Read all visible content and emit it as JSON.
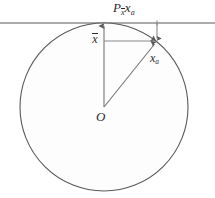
{
  "figure": {
    "name": "projection-of-xa-onto-xbar",
    "background_color": "#ffffff",
    "stroke_color": "#595959",
    "label_color": "#2b2b2b",
    "circle_fill": "#fdfdfd",
    "width": 215,
    "height": 198
  },
  "labels": {
    "projection": {
      "base": "P",
      "sub_base": "x",
      "sub_overbar": true,
      "operand_base": "x",
      "operand_sub": "a",
      "text": "P"
    },
    "xbar": {
      "base": "x",
      "overbar": true,
      "text": "x"
    },
    "xa": {
      "base": "x",
      "sub": "a",
      "text": "x"
    },
    "origin": {
      "text": "O"
    }
  },
  "text": {
    "projection_main": "P",
    "projection_sub_x": "x",
    "projection_operand": "x",
    "projection_operand_sub": "a",
    "xbar_main": "x",
    "xa_main": "x",
    "xa_sub": "a",
    "origin_main": "O"
  },
  "geometry": {
    "circle": {
      "cx": 104,
      "cy": 107,
      "r": 84
    },
    "origin_point": {
      "x": 104,
      "y": 107
    },
    "tangent_point": {
      "x": 104,
      "y": 23
    },
    "xa_point": {
      "x": 157,
      "y": 41
    },
    "projection_point": {
      "x": 157,
      "y": 23
    },
    "horizontal_line": {
      "y": 23,
      "x_start": 0,
      "x_end": 215
    },
    "xbar_vector": {
      "from": [
        104,
        107
      ],
      "to": [
        104,
        25
      ]
    },
    "xa_vector": {
      "from": [
        104,
        107
      ],
      "to": [
        157,
        41
      ]
    },
    "horizontal_connector": {
      "from": [
        104,
        41
      ],
      "to": [
        157,
        41
      ]
    },
    "vertical_connector": {
      "from": [
        157,
        23
      ],
      "to": [
        157,
        41
      ]
    }
  }
}
